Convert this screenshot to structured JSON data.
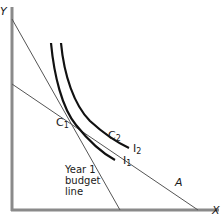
{
  "diagram": {
    "type": "indifference-curve-budget-line",
    "axes": {
      "y_label": "Y",
      "x_label": "X"
    },
    "lines": {
      "year1_budget_line": {
        "label_line1": "Year 1",
        "label_line2": "budget",
        "label_line3": "line"
      },
      "line_a": {
        "label": "A"
      }
    },
    "curves": [
      {
        "name": "I",
        "subscript": "1"
      },
      {
        "name": "I",
        "subscript": "2"
      }
    ],
    "points": [
      {
        "name": "C",
        "subscript": "1"
      },
      {
        "name": "C",
        "subscript": "2"
      }
    ],
    "colors": {
      "axis": "#8a8a8a",
      "budget_line": "#555555",
      "curve": "#111111",
      "text": "#1a1a1a"
    }
  }
}
